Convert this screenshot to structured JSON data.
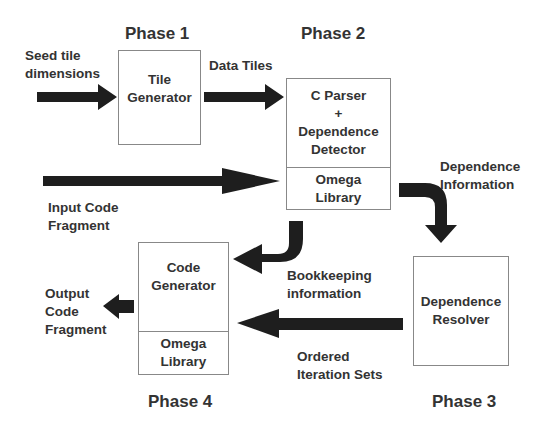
{
  "diagram": {
    "phases": {
      "phase1": "Phase 1",
      "phase2": "Phase 2",
      "phase3": "Phase 3",
      "phase4": "Phase 4"
    },
    "boxes": {
      "tile_generator": {
        "line1": "Tile",
        "line2": "Generator"
      },
      "parser_detector": {
        "line1": "C Parser",
        "line2": "+",
        "line3": "Dependence",
        "line4": "Detector",
        "lib_line1": "Omega",
        "lib_line2": "Library"
      },
      "dependence_resolver": {
        "line1": "Dependence",
        "line2": "Resolver"
      },
      "code_generator": {
        "line1": "Code",
        "line2": "Generator",
        "lib_line1": "Omega",
        "lib_line2": "Library"
      }
    },
    "edge_labels": {
      "seed_tile_1": "Seed tile",
      "seed_tile_2": "dimensions",
      "data_tiles": "Data Tiles",
      "input_code_1": "Input Code",
      "input_code_2": "Fragment",
      "dependence_info_1": "Dependence",
      "dependence_info_2": "Information",
      "bookkeeping_1": "Bookkeeping",
      "bookkeeping_2": "information",
      "ordered_sets_1": "Ordered",
      "ordered_sets_2": "Iteration Sets",
      "output_code_1": "Output",
      "output_code_2": "Code",
      "output_code_3": "Fragment"
    },
    "colors": {
      "arrow": "#1e1e1e",
      "box_border": "#888888",
      "text": "#333333"
    }
  }
}
